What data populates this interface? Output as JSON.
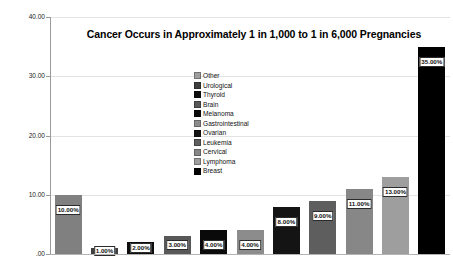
{
  "chart_data": {
    "type": "bar",
    "title": "Cancer Occurs in Approximately 1 in 1,000 to 1 in 6,000 Pregnancies",
    "xlabel": "",
    "ylabel": "Percent of Cancers Diagosed in Pregnancy",
    "ylim": [
      0,
      40
    ],
    "grid": true,
    "legend_position": "inside-center-upper",
    "ytick_labels": [
      ".00",
      "10.00",
      "20.00",
      "30.00",
      "40.00"
    ],
    "ytick_values": [
      0,
      10,
      20,
      30,
      40
    ],
    "categories": [
      "Other",
      "Urological",
      "Thyroid",
      "Brain",
      "Melanoma",
      "Gastrointestinal",
      "Ovarian",
      "Leukemia",
      "Cervical",
      "Lymphoma",
      "Breast"
    ],
    "values": [
      10,
      1,
      2,
      3,
      4,
      4,
      8,
      9,
      11,
      13,
      35
    ],
    "data_labels": [
      "10.00%",
      "1.00%",
      "2.00%",
      "3.00%",
      "4.00%",
      "4.00%",
      "8.00%",
      "9.00%",
      "11.00%",
      "13.00%",
      "35.00%"
    ],
    "bar_colors": [
      "#808080",
      "#3f3f3f",
      "#0d0d0d",
      "#585858",
      "#0a0a0a",
      "#8c8c8c",
      "#141414",
      "#5e5e5e",
      "#878787",
      "#9e9e9e",
      "#000000"
    ]
  },
  "legend": {
    "items": [
      {
        "label": "Other",
        "color": "#9e9e9e"
      },
      {
        "label": "Urological",
        "color": "#3f3f3f"
      },
      {
        "label": "Thyroid",
        "color": "#0d0d0d"
      },
      {
        "label": "Brain",
        "color": "#585858"
      },
      {
        "label": "Melanoma",
        "color": "#0a0a0a"
      },
      {
        "label": "Gastrointestinal",
        "color": "#8c8c8c"
      },
      {
        "label": "Ovarian",
        "color": "#141414"
      },
      {
        "label": "Leukemia",
        "color": "#5e5e5e"
      },
      {
        "label": "Cervical",
        "color": "#878787"
      },
      {
        "label": "Lymphoma",
        "color": "#9e9e9e"
      },
      {
        "label": "Breast",
        "color": "#000000"
      }
    ]
  },
  "colors": {
    "background": "#ffffff",
    "axis": "#9a9a9a",
    "gridline": "#e3e3e3",
    "text": "#111111",
    "label_box_border": "#2b2b2b"
  }
}
